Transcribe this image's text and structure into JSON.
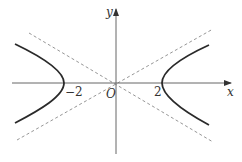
{
  "figure": {
    "type": "hyperbola",
    "axes": {
      "x_label": "x",
      "y_label": "y",
      "origin_label": "O"
    },
    "tick_labels": {
      "left_vertex": "−2",
      "right_vertex": "2"
    },
    "colors": {
      "curve": "#2a2a2a",
      "axis": "#555555",
      "asymptote": "#8a8a8a",
      "text": "#333333"
    },
    "vertices": [
      -2,
      2
    ],
    "asymptotes": "dashed lines through origin"
  }
}
